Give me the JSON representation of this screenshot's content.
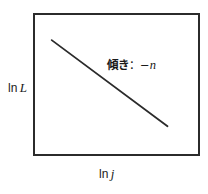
{
  "figure": {
    "kind": "schematic-log-log-plot",
    "background_color": "#ffffff",
    "frame_color": "#2b2b2b",
    "line_color": "#2b2b2b"
  },
  "axes": {
    "y_label_prefix": "ln",
    "y_label_variable": "L",
    "x_label_prefix": "ln",
    "x_label_variable": "j"
  },
  "annotation": {
    "label_jp": "傾き",
    "separator": "：",
    "minus_sign": "−",
    "variable": "n",
    "full_text": "傾き：−n"
  },
  "chart_data": {
    "type": "line",
    "title": "",
    "subtitle": "",
    "xlabel": "ln j",
    "ylabel": "ln L",
    "grid": false,
    "legend": null,
    "xlim": [
      0,
      1
    ],
    "ylim": [
      0,
      1
    ],
    "tick_labels": {
      "x": [],
      "y": []
    },
    "series": [
      {
        "name": "slope line",
        "x": [
          0.115,
          0.825
        ],
        "y": [
          0.805,
          0.185
        ],
        "slope_label": "傾き：−n",
        "color": "#2b2b2b",
        "width_px": 1.8
      }
    ],
    "annotations": [
      {
        "text": "傾き：−n",
        "x": 0.47,
        "y": 0.66
      }
    ]
  }
}
